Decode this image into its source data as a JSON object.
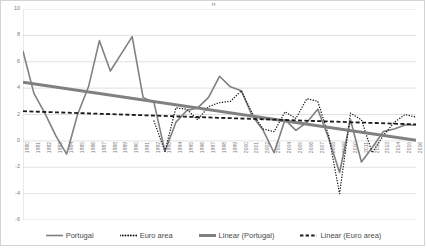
{
  "title_partial": "g",
  "legend": {
    "items": [
      {
        "label": "Portugal",
        "marker": "solid-line-icon",
        "color": "#808080",
        "style": "solid",
        "width": 1.6
      },
      {
        "label": "Euro area",
        "marker": "dotted-line-icon",
        "color": "#1a1a1a",
        "style": "dotted",
        "width": 1.4
      },
      {
        "label": "Linear (Portugal)",
        "marker": "thick-solid-line-icon",
        "color": "#808080",
        "style": "solid",
        "width": 3.0
      },
      {
        "label": "Linear (Euro area)",
        "marker": "dashed-line-icon",
        "color": "#1a1a1a",
        "style": "dashed",
        "width": 1.8
      }
    ]
  },
  "chart_data": {
    "type": "line",
    "title": "",
    "xlabel": "",
    "ylabel": "",
    "ylim": [
      -6,
      10
    ],
    "ytick_values": [
      10,
      8,
      6,
      4,
      2,
      0,
      -2,
      -4,
      -6
    ],
    "ytick_labels": [
      "10",
      "8",
      "6",
      "4",
      "2",
      "0",
      "-2",
      "-4",
      "-6"
    ],
    "grid": true,
    "grid_color": "#d9d9d9",
    "legend_position": "bottom",
    "categories": [
      "1980",
      "1981",
      "1982",
      "1983",
      "1984",
      "1985",
      "1986",
      "1987",
      "1988",
      "1989",
      "1990",
      "1991",
      "1992",
      "1993",
      "1994",
      "1995",
      "1996",
      "1997",
      "1998",
      "1999",
      "2000",
      "2001",
      "2002",
      "2003",
      "2004",
      "2005",
      "2006",
      "2007",
      "2008",
      "2009",
      "2010",
      "2011",
      "2012",
      "2013",
      "2014",
      "2015",
      "2016"
    ],
    "series": [
      {
        "name": "Portugal",
        "style": "solid",
        "color": "#808080",
        "width": 1.6,
        "values": [
          6.8,
          3.6,
          2.1,
          0.4,
          -1.0,
          2.0,
          4.1,
          7.6,
          5.3,
          6.6,
          7.9,
          3.3,
          2.9,
          -0.8,
          1.4,
          2.3,
          2.5,
          3.3,
          4.9,
          4.1,
          3.8,
          1.9,
          0.8,
          -0.9,
          1.6,
          0.8,
          1.4,
          2.4,
          0.2,
          -2.4,
          1.6,
          -1.6,
          -0.5,
          0.7,
          0.9,
          1.2,
          1.2
        ]
      },
      {
        "name": "Euro area",
        "style": "dotted",
        "color": "#1a1a1a",
        "width": 1.4,
        "values": [
          null,
          null,
          null,
          null,
          null,
          null,
          null,
          null,
          null,
          null,
          null,
          null,
          1.5,
          -0.8,
          2.5,
          2.4,
          1.6,
          2.6,
          2.9,
          3.0,
          3.8,
          2.1,
          0.9,
          0.7,
          2.2,
          1.7,
          3.2,
          3.0,
          0.4,
          -4.0,
          2.1,
          1.6,
          -0.9,
          0.4,
          1.4,
          2.0,
          1.8
        ]
      },
      {
        "name": "Linear (Portugal)",
        "style": "trend-solid",
        "color": "#808080",
        "width": 3.0,
        "start": 4.45,
        "end": 0.05
      },
      {
        "name": "Linear (Euro area)",
        "style": "trend-dashed",
        "color": "#1a1a1a",
        "width": 1.8,
        "start": 2.25,
        "end": 1.25
      }
    ]
  }
}
